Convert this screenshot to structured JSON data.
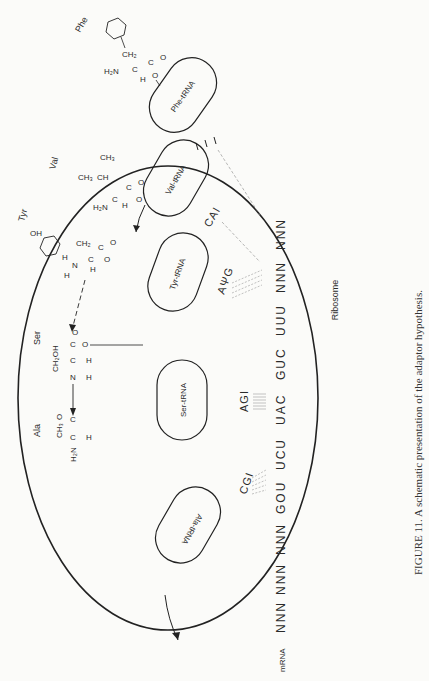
{
  "figure": {
    "caption": "FIGURE 11. A schematic presentation of the adaptor hypothesis.",
    "ribosome_label": "Ribosome",
    "mrna_label": "mRNA",
    "mrna_codons": [
      "NNN",
      "NNN",
      "NNN",
      "GOU",
      "UCU",
      "UAC",
      "GUC",
      "UUU",
      "NNN",
      "NNN"
    ],
    "trnas": [
      {
        "label": "Ala-tRNA",
        "anticodon": "CGI",
        "amino_acid": "Ala"
      },
      {
        "label": "Ser-tRNA",
        "anticodon": "AGI",
        "amino_acid": "Ser"
      },
      {
        "label": "Tyr-tRNA",
        "anticodon": "AΨG",
        "amino_acid": "Tyr"
      },
      {
        "label": "Val-tRNA",
        "anticodon": "CAI",
        "amino_acid": "Val"
      },
      {
        "label": "Phe-tRNA",
        "anticodon": "",
        "amino_acid": "Phe"
      }
    ],
    "chemistry": {
      "ala": {
        "h2n": "H₂N",
        "ch3": "CH₃",
        "o": "O",
        "c": "C",
        "h": "H"
      },
      "ser": {
        "ch2oh": "CH₂OH",
        "n": "N",
        "c": "C",
        "o": "O",
        "h": "H"
      },
      "tyr": {
        "oh": "OH",
        "ch2": "CH₂",
        "n": "N",
        "c": "C",
        "o": "O",
        "h": "H"
      },
      "val": {
        "ch3a": "CH₃",
        "ch3b": "CH₃",
        "ch": "CH",
        "h2n": "H₂N",
        "c": "C",
        "o": "O",
        "h": "H"
      },
      "phe": {
        "ch2": "CH₂",
        "h2n": "H₂N",
        "c": "C",
        "o": "O",
        "h": "H"
      }
    }
  }
}
